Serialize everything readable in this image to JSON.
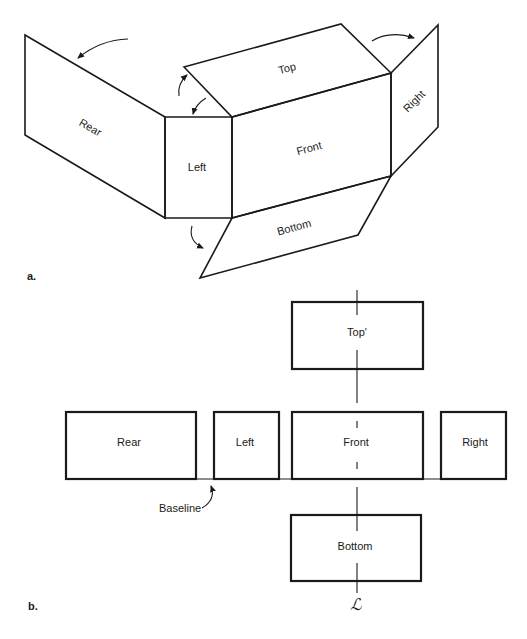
{
  "part_a": {
    "label": "a.",
    "faces": {
      "rear": "Rear",
      "left": "Left",
      "top": "Top",
      "front": "Front",
      "right": "Right",
      "bottom": "Bottom"
    }
  },
  "part_b": {
    "label": "b.",
    "boxes": {
      "top": "Top'",
      "rear": "Rear",
      "left": "Left",
      "front": "Front",
      "right": "Right",
      "bottom": "Bottom"
    },
    "baseline_label": "Baseline",
    "centerline_symbol": "ℒ"
  }
}
